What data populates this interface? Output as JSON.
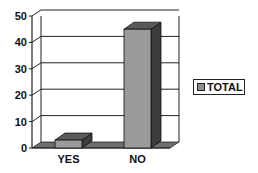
{
  "chart_data": {
    "type": "bar",
    "style": "3d-column",
    "title": "",
    "xlabel": "",
    "ylabel": "",
    "categories": [
      "YES",
      "NO"
    ],
    "series": [
      {
        "name": "TOTAL",
        "values": [
          3,
          45
        ]
      }
    ],
    "ylim": [
      0,
      50
    ],
    "yticks": [
      0,
      10,
      20,
      30,
      40,
      50
    ],
    "grid": true,
    "legend_position": "right"
  },
  "colors": {
    "bar_front": "#9a9a9a",
    "bar_top": "#5a5a5a",
    "bar_side": "#3c3c3c",
    "floor": "#6e6e6e",
    "grid": "#222222"
  }
}
